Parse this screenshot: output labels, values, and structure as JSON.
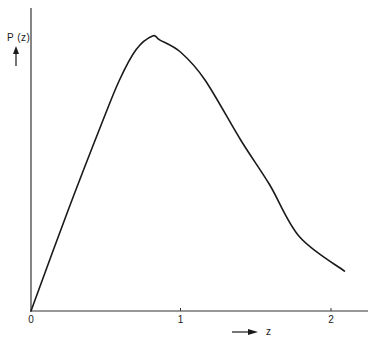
{
  "chart_data": {
    "type": "line",
    "title": "",
    "xlabel": "z",
    "ylabel": "P(z)",
    "xlim": [
      0,
      2.2
    ],
    "ylim": [
      0,
      1.1
    ],
    "x_ticks": [
      "0",
      "1",
      "2"
    ],
    "y_ticks": [],
    "grid": false,
    "legend": null,
    "series": [
      {
        "name": "P(z)",
        "x": [
          0,
          0.25,
          0.47,
          0.59,
          0.7,
          0.81,
          0.86,
          1.0,
          1.16,
          1.4,
          1.59,
          1.79,
          2.09
        ],
        "y": [
          0,
          0.37,
          0.68,
          0.84,
          0.95,
          1.0,
          0.985,
          0.94,
          0.84,
          0.62,
          0.46,
          0.27,
          0.145
        ]
      }
    ]
  },
  "axes": {
    "y_label": "P (z)",
    "x_label": "z",
    "x_tick_labels": [
      "0",
      "1",
      "2"
    ]
  },
  "colors": {
    "line": "#1a1a1a",
    "axis": "#333333",
    "background": "#ffffff"
  }
}
